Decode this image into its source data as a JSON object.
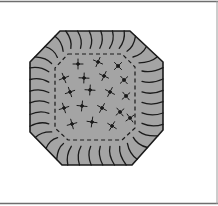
{
  "illustration": {
    "subject": "octagonal ruffled cushion",
    "colors": {
      "background": "#ffffff",
      "fill": "#a4a4a4",
      "line": "#1a1a1a",
      "frame": "#6e6e6e"
    },
    "outer_octagon": [
      [
        60,
        31
      ],
      [
        130,
        31
      ],
      [
        163,
        62
      ],
      [
        163,
        130
      ],
      [
        132,
        165
      ],
      [
        62,
        165
      ],
      [
        30,
        132
      ],
      [
        30,
        62
      ]
    ],
    "inner_dashed_octagon": [
      [
        68,
        54
      ],
      [
        122,
        54
      ],
      [
        135,
        67
      ],
      [
        135,
        128
      ],
      [
        122,
        140
      ],
      [
        68,
        140
      ],
      [
        55,
        128
      ],
      [
        55,
        68
      ]
    ],
    "flowers": [
      [
        78,
        64
      ],
      [
        98,
        62
      ],
      [
        118,
        66
      ],
      [
        64,
        78
      ],
      [
        84,
        78
      ],
      [
        104,
        76
      ],
      [
        124,
        80
      ],
      [
        70,
        92
      ],
      [
        90,
        90
      ],
      [
        110,
        92
      ],
      [
        126,
        96
      ],
      [
        64,
        108
      ],
      [
        82,
        106
      ],
      [
        102,
        108
      ],
      [
        120,
        112
      ],
      [
        72,
        124
      ],
      [
        92,
        122
      ],
      [
        112,
        126
      ],
      [
        130,
        118
      ]
    ]
  }
}
